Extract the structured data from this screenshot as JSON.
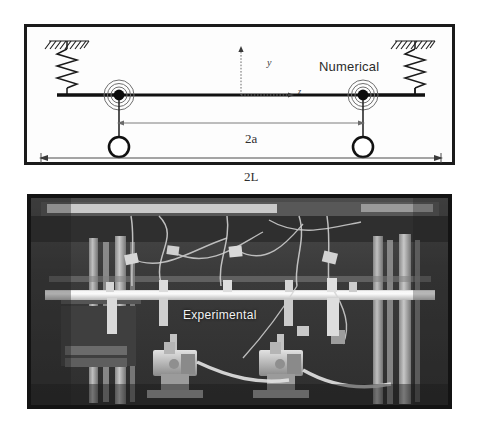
{
  "figure": {
    "width": 479,
    "height": 435,
    "background": "#ffffff"
  },
  "numerical": {
    "title": "Numerical",
    "frame_color": "#1a1a1a",
    "beam_color": "#111111",
    "axes": {
      "y_label": "y",
      "z_label": "z"
    },
    "dimensions": [
      {
        "name": "half-span-between-masses",
        "label": "2a"
      },
      {
        "name": "full-beam-length",
        "label": "2L"
      }
    ],
    "supports": [
      {
        "name": "left-spring-support",
        "type": "spring"
      },
      {
        "name": "right-spring-support",
        "type": "spring"
      }
    ],
    "attachments": [
      {
        "name": "left-pulley-mass",
        "type": "concentric-hub-with-mass"
      },
      {
        "name": "right-pulley-mass",
        "type": "concentric-hub-with-mass"
      }
    ]
  },
  "experimental": {
    "title": "Experimental",
    "frame_color": "#131313",
    "title_color": "#f2f2f2",
    "equipment": [
      {
        "name": "left-shaker",
        "label": ""
      },
      {
        "name": "right-shaker",
        "label": ""
      },
      {
        "name": "horizontal-beam",
        "label": ""
      },
      {
        "name": "left-vertical-frame",
        "label": ""
      },
      {
        "name": "right-vertical-frame",
        "label": ""
      }
    ]
  }
}
